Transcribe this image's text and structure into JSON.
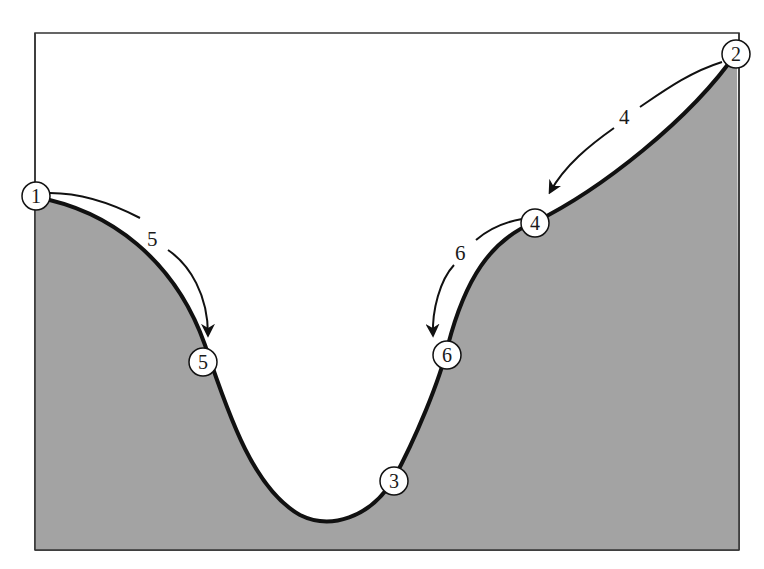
{
  "diagram": {
    "type": "terrain-profile-with-transitions",
    "colors": {
      "background": "#ffffff",
      "terrain_fill": "#a3a3a3",
      "curve": "#111111",
      "frame": "#333333",
      "node_fill": "#ffffff"
    },
    "nodes": [
      {
        "id": "1",
        "label": "1"
      },
      {
        "id": "2",
        "label": "2"
      },
      {
        "id": "3",
        "label": "3"
      },
      {
        "id": "4",
        "label": "4"
      },
      {
        "id": "5",
        "label": "5"
      },
      {
        "id": "6",
        "label": "6"
      }
    ],
    "transitions": [
      {
        "from": "1",
        "to": "5",
        "label": "5"
      },
      {
        "from": "2",
        "to": "4",
        "label": "4"
      },
      {
        "from": "4",
        "to": "6",
        "label": "6"
      }
    ]
  }
}
